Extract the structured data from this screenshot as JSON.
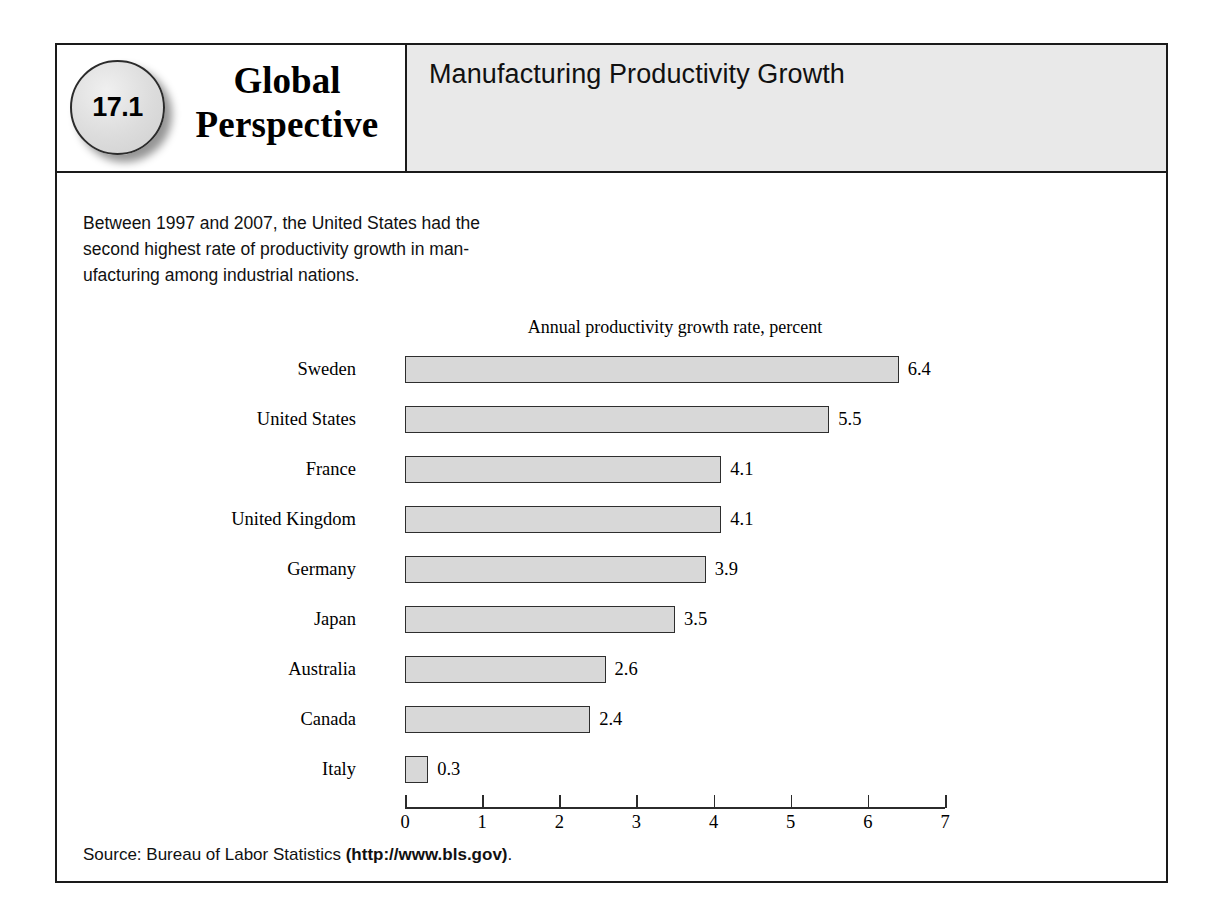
{
  "badge": {
    "number": "17.1"
  },
  "wordmark": {
    "line1": "Global",
    "line2": "Perspective"
  },
  "header": {
    "title": "Manufacturing Productivity Growth"
  },
  "intro": {
    "line1": "Between 1997 and 2007, the United States had the",
    "line2": "second highest rate of productivity growth in man-",
    "line3": "ufacturing among industrial nations."
  },
  "source": {
    "prefix": "Source: Bureau of Labor Statistics ",
    "url": "(http://www.bls.gov)",
    "suffix": "."
  },
  "colors": {
    "bar_fill": "#d8d8d8",
    "bar_border": "#2e2e2e",
    "header_band": "#e9e9e9",
    "frame": "#1a1a1a"
  },
  "chart_data": {
    "type": "bar",
    "orientation": "horizontal",
    "title": "Manufacturing Productivity Growth",
    "subtitle": "Annual productivity growth rate, percent",
    "xlabel": "",
    "ylabel": "",
    "xlim": [
      0,
      7
    ],
    "grid": false,
    "legend": null,
    "xticks": [
      "0",
      "1",
      "2",
      "3",
      "4",
      "5",
      "6",
      "7"
    ],
    "categories": [
      "Sweden",
      "United States",
      "France",
      "United Kingdom",
      "Germany",
      "Japan",
      "Australia",
      "Canada",
      "Italy"
    ],
    "values": [
      6.4,
      5.5,
      4.1,
      4.1,
      3.9,
      3.5,
      2.6,
      2.4,
      0.3
    ],
    "value_labels": [
      "6.4",
      "5.5",
      "4.1",
      "4.1",
      "3.9",
      "3.5",
      "2.6",
      "2.4",
      "0.3"
    ]
  }
}
